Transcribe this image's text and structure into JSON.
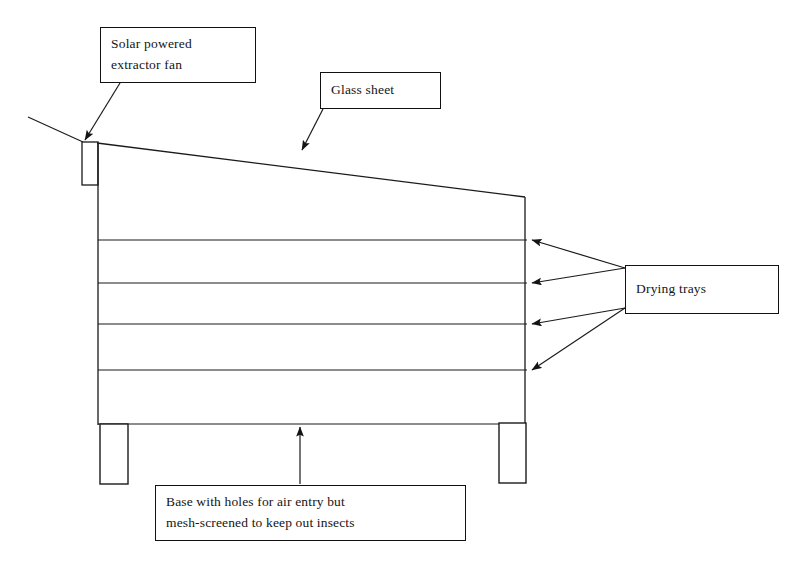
{
  "diagram": {
    "stroke_color": "#1a1a1a",
    "fill_color": "#ffffff",
    "callouts": {
      "fan": {
        "name": "solar-powered-extractor-fan",
        "line1": "Solar powered",
        "line2": "extractor fan"
      },
      "glass": {
        "name": "glass-sheet",
        "line1": "Glass sheet"
      },
      "trays": {
        "name": "drying-trays",
        "line1": "Drying trays"
      },
      "base": {
        "name": "base-with-holes",
        "line1": "Base with holes for air entry but",
        "line2": "mesh-screened to keep out insects"
      }
    },
    "parts": {
      "glass_sheet": "glass-sheet-line",
      "left_wall": "left-wall",
      "right_wall": "right-wall",
      "base": "base-line",
      "left_leg": "left-leg",
      "right_leg": "right-leg",
      "fan_body": "extractor-fan-body",
      "roof_overhang": "roof-overhang-line",
      "tray_count": 4
    }
  }
}
